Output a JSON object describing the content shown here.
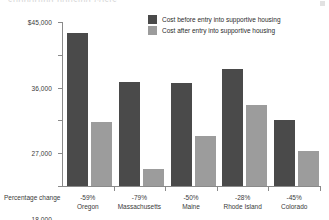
{
  "figure": {
    "title_remnant": "supporting housing costs",
    "percentage_change_label": "Percentage change"
  },
  "legend": {
    "position": "top-right",
    "items": [
      {
        "label": "Cost before entry into supportive housing",
        "color": "#4a4a4a",
        "key": "before"
      },
      {
        "label": "Cost after entry into supportive housing",
        "color": "#9c9c9c",
        "key": "after"
      }
    ]
  },
  "axis": {
    "y_ticks": [
      {
        "value": 45000,
        "label": "$45,000"
      },
      {
        "value": 36000,
        "label": "36,000"
      },
      {
        "value": 27000,
        "label": "27,000"
      },
      {
        "value": 18000,
        "label": "18,000"
      },
      {
        "value": 9000,
        "label": "9,000"
      },
      {
        "value": 0,
        "label": "0"
      }
    ]
  },
  "chart_data": {
    "type": "bar",
    "title": "",
    "xlabel": "Percentage change",
    "ylabel": "",
    "ylim": [
      0,
      45000
    ],
    "grid": false,
    "legend_position": "top-right",
    "categories": [
      "Oregon",
      "Massachusetts",
      "Maine",
      "Rhode Island",
      "Colorado"
    ],
    "percentage_change": [
      "-59%",
      "-79%",
      "-50%",
      "-28%",
      "-45%"
    ],
    "series": [
      {
        "name": "Cost before entry into supportive housing",
        "color": "#4a4a4a",
        "values": [
          42000,
          28500,
          28300,
          32000,
          18000
        ]
      },
      {
        "name": "Cost after entry into supportive housing",
        "color": "#9c9c9c",
        "values": [
          17500,
          4700,
          13700,
          22200,
          9600
        ]
      }
    ],
    "groups": [
      {
        "category": "Oregon",
        "percentage_change": "-59%",
        "before": 42000,
        "after": 17500
      },
      {
        "category": "Massachusetts",
        "percentage_change": "-79%",
        "before": 28500,
        "after": 4700
      },
      {
        "category": "Maine",
        "percentage_change": "-50%",
        "before": 28300,
        "after": 13700
      },
      {
        "category": "Rhode Island",
        "percentage_change": "-28%",
        "before": 32000,
        "after": 22200
      },
      {
        "category": "Colorado",
        "percentage_change": "-45%",
        "before": 18000,
        "after": 9600
      }
    ]
  }
}
